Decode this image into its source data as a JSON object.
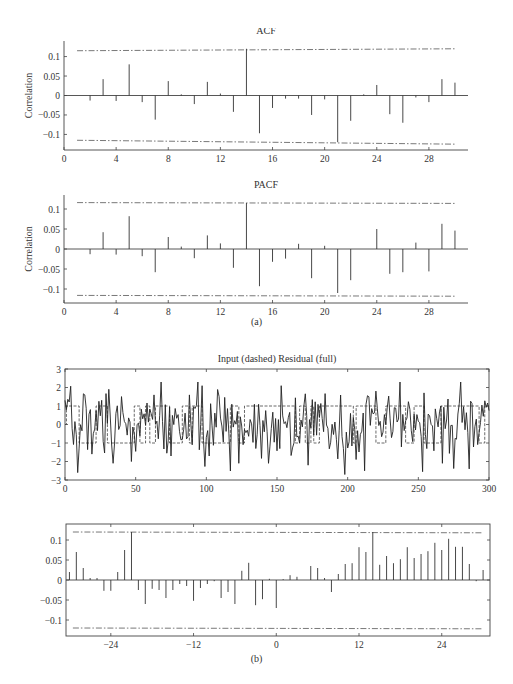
{
  "figure": {
    "caption_a": "(a)",
    "caption_b": "(b)"
  },
  "chart_data": [
    {
      "id": "acf",
      "type": "bar",
      "style": "stem",
      "title": "ACF",
      "xlabel": "",
      "ylabel": "Correlation",
      "xlim": [
        0,
        31
      ],
      "ylim": [
        -0.14,
        0.14
      ],
      "xticks": [
        0,
        4,
        8,
        12,
        16,
        20,
        24,
        28
      ],
      "yticks": [
        -0.1,
        -0.05,
        0,
        0.05,
        0.1
      ],
      "ytick_labels": [
        "−0.1",
        "−0.05",
        "0",
        "0.05",
        "0.1"
      ],
      "grid": false,
      "confidence_bounds": {
        "upper_start": 0.115,
        "upper_end": 0.12,
        "lower_start": -0.115,
        "lower_end": -0.125,
        "x_range": [
          1,
          30
        ],
        "style": "dash-dot"
      },
      "categories": [
        1,
        2,
        3,
        4,
        5,
        6,
        7,
        8,
        9,
        10,
        11,
        12,
        13,
        14,
        15,
        16,
        17,
        18,
        19,
        20,
        21,
        22,
        23,
        24,
        25,
        26,
        27,
        28,
        29,
        30
      ],
      "values": [
        0.0,
        -0.013,
        0.042,
        -0.014,
        0.08,
        -0.017,
        -0.062,
        0.037,
        0.003,
        -0.022,
        0.035,
        0.005,
        -0.042,
        0.12,
        -0.097,
        -0.032,
        -0.008,
        -0.008,
        -0.05,
        -0.01,
        -0.12,
        -0.065,
        0.003,
        0.027,
        -0.048,
        -0.07,
        -0.005,
        -0.017,
        0.042,
        0.033
      ]
    },
    {
      "id": "pacf",
      "type": "bar",
      "style": "stem",
      "title": "PACF",
      "xlabel": "",
      "ylabel": "Correlation",
      "xlim": [
        0,
        31
      ],
      "ylim": [
        -0.135,
        0.135
      ],
      "xticks": [
        0,
        4,
        8,
        12,
        16,
        20,
        24,
        28
      ],
      "yticks": [
        -0.1,
        -0.05,
        0,
        0.05,
        0.1
      ],
      "ytick_labels": [
        "−0.1",
        "−0.05",
        "0",
        "0.05",
        "0.1"
      ],
      "grid": false,
      "confidence_bounds": {
        "upper_start": 0.116,
        "upper_end": 0.114,
        "lower_start": -0.116,
        "lower_end": -0.118,
        "x_range": [
          1,
          30
        ],
        "style": "dash-dot"
      },
      "categories": [
        1,
        2,
        3,
        4,
        5,
        6,
        7,
        8,
        9,
        10,
        11,
        12,
        13,
        14,
        15,
        16,
        17,
        18,
        19,
        20,
        21,
        22,
        23,
        24,
        25,
        26,
        27,
        28,
        29,
        30
      ],
      "values": [
        0.0,
        -0.013,
        0.042,
        -0.014,
        0.082,
        -0.018,
        -0.058,
        0.03,
        0.006,
        -0.023,
        0.034,
        0.014,
        -0.047,
        0.115,
        -0.093,
        -0.032,
        -0.024,
        0.013,
        -0.073,
        0.008,
        -0.11,
        -0.078,
        0.0,
        0.05,
        -0.062,
        -0.058,
        0.016,
        -0.056,
        0.063,
        0.046
      ]
    },
    {
      "id": "input-residual",
      "type": "line",
      "title": "Input (dashed) Residual (full)",
      "xlabel": "",
      "ylabel": "",
      "xlim": [
        0,
        300
      ],
      "ylim": [
        -3,
        3
      ],
      "xticks": [
        0,
        50,
        100,
        150,
        200,
        250,
        300
      ],
      "yticks": [
        -3,
        -2,
        -1,
        0,
        1,
        2,
        3
      ],
      "ytick_labels": [
        "−3",
        "−2",
        "−1",
        "0",
        "1",
        "2",
        "3"
      ],
      "grid": false,
      "series": [
        {
          "name": "Input",
          "style": "dashed",
          "kind": "step",
          "segments": [
            [
              0,
              0
            ],
            [
              1,
              1
            ],
            [
              10,
              -1
            ],
            [
              22,
              1
            ],
            [
              30,
              -1
            ],
            [
              49,
              1
            ],
            [
              53,
              -1
            ],
            [
              57,
              1
            ],
            [
              60,
              -1
            ],
            [
              64,
              1
            ],
            [
              74,
              -1
            ],
            [
              83,
              1
            ],
            [
              88,
              -1
            ],
            [
              90,
              1
            ],
            [
              97,
              -1
            ],
            [
              117,
              1
            ],
            [
              123,
              -1
            ],
            [
              127,
              1
            ],
            [
              163,
              -1
            ],
            [
              166,
              1
            ],
            [
              170,
              -1
            ],
            [
              174,
              1
            ],
            [
              176,
              -1
            ],
            [
              180,
              1
            ],
            [
              190,
              1
            ],
            [
              204,
              -1
            ],
            [
              206,
              1
            ],
            [
              218,
              1
            ],
            [
              220,
              -1
            ],
            [
              227,
              1
            ],
            [
              233,
              1
            ],
            [
              241,
              -1
            ],
            [
              247,
              1
            ],
            [
              254,
              -1
            ],
            [
              266,
              1
            ],
            [
              272,
              1
            ],
            [
              280,
              1
            ],
            [
              293,
              -1
            ],
            [
              297,
              1
            ],
            [
              300,
              1
            ]
          ]
        },
        {
          "name": "Residual",
          "style": "solid",
          "kind": "noise",
          "n": 300,
          "seed": 7,
          "std": 0.9,
          "min": -2.7,
          "max": 2.3,
          "peaks": [
            [
              9,
              -2.6
            ],
            [
              14,
              1.6
            ],
            [
              19,
              -1.6
            ],
            [
              31,
              1.9
            ],
            [
              34,
              -2.1
            ],
            [
              47,
              -2.0
            ],
            [
              63,
              1.6
            ],
            [
              75,
              -1.7
            ],
            [
              88,
              1.6
            ],
            [
              97,
              2.1
            ],
            [
              102,
              -1.7
            ],
            [
              118,
              1.1
            ],
            [
              123,
              -2.1
            ],
            [
              144,
              -2.1
            ],
            [
              153,
              2.1
            ],
            [
              172,
              -2.2
            ],
            [
              198,
              -2.7
            ],
            [
              212,
              -2.5
            ],
            [
              237,
              2.3
            ],
            [
              267,
              -2.1
            ],
            [
              280,
              2.3
            ],
            [
              286,
              -2.4
            ]
          ]
        }
      ]
    },
    {
      "id": "cross-correlation",
      "type": "bar",
      "style": "stem",
      "title": "",
      "xlabel": "",
      "ylabel": "",
      "xlim": [
        -30.5,
        31
      ],
      "ylim": [
        -0.14,
        0.14
      ],
      "xticks": [
        -24,
        -12,
        0,
        12,
        24
      ],
      "xtick_labels": [
        "−24",
        "−12",
        "0",
        "12",
        "24"
      ],
      "yticks": [
        -0.1,
        -0.05,
        0,
        0.05,
        0.1
      ],
      "ytick_labels": [
        "−0.1",
        "−0.05",
        "0",
        "0.05",
        "0.1"
      ],
      "grid": false,
      "confidence_bounds": {
        "upper_start": 0.12,
        "upper_end": 0.118,
        "lower_start": -0.12,
        "lower_end": -0.122,
        "x_range": [
          -29.5,
          30
        ],
        "style": "dash-dot"
      },
      "categories": [
        -30,
        -29,
        -28,
        -27,
        -26,
        -25,
        -24,
        -23,
        -22,
        -21,
        -20,
        -19,
        -18,
        -17,
        -16,
        -15,
        -14,
        -13,
        -12,
        -11,
        -10,
        -9,
        -8,
        -7,
        -6,
        -5,
        -4,
        -3,
        -2,
        -1,
        0,
        1,
        2,
        3,
        4,
        5,
        6,
        7,
        8,
        9,
        10,
        11,
        12,
        13,
        14,
        15,
        16,
        17,
        18,
        19,
        20,
        21,
        22,
        23,
        24,
        25,
        26,
        27,
        28,
        29,
        30
      ],
      "values": [
        0.02,
        0.07,
        0.03,
        0.005,
        0.005,
        -0.027,
        -0.027,
        0.02,
        0.075,
        0.12,
        -0.025,
        -0.06,
        -0.022,
        -0.025,
        -0.045,
        -0.025,
        -0.01,
        -0.015,
        -0.052,
        -0.02,
        -0.01,
        -0.003,
        -0.045,
        -0.03,
        -0.06,
        0.023,
        0.043,
        -0.063,
        -0.048,
        0.003,
        -0.07,
        0.002,
        0.012,
        0.008,
        0.0,
        0.035,
        0.03,
        0.005,
        -0.03,
        0.015,
        0.04,
        0.042,
        0.082,
        0.07,
        0.12,
        0.038,
        0.06,
        0.042,
        0.052,
        0.082,
        0.055,
        0.065,
        0.072,
        0.093,
        0.075,
        0.103,
        0.083,
        0.083,
        0.04,
        -0.003,
        0.025
      ]
    }
  ]
}
